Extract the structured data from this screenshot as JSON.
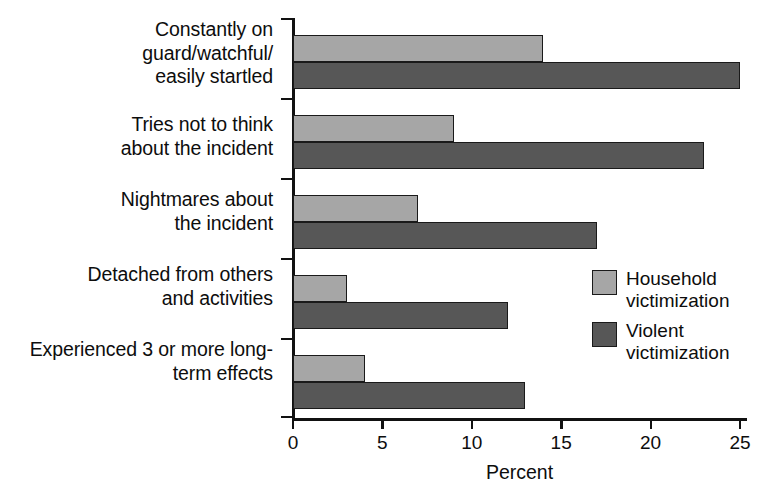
{
  "chart_data": {
    "type": "bar",
    "orientation": "horizontal",
    "title": "",
    "xlabel": "Percent",
    "ylabel": "",
    "xlim": [
      0,
      25
    ],
    "xticks": [
      0,
      5,
      10,
      15,
      20,
      25
    ],
    "xtick_labels": [
      "0",
      "5",
      "10",
      "15",
      "20",
      "25"
    ],
    "grid": false,
    "legend_position": "center-right",
    "categories": [
      "Constantly on\nguard/watchful/\neasily startled",
      "Tries not to think\nabout the incident",
      "Nightmares about\nthe incident",
      "Detached from others\nand activities",
      "Experienced 3 or more long-\nterm effects"
    ],
    "series": [
      {
        "name": "Household\nvictimization",
        "color": "#a6a6a6",
        "values": [
          14,
          9,
          7,
          3,
          4
        ]
      },
      {
        "name": "Violent\nvictimization",
        "color": "#575757",
        "values": [
          25,
          23,
          17,
          12,
          13
        ]
      }
    ]
  },
  "legend": {
    "items": [
      {
        "label": "Household\nvictimization",
        "color": "#a6a6a6"
      },
      {
        "label": "Violent\nvictimization",
        "color": "#575757"
      }
    ]
  },
  "axis": {
    "x_title": "Percent"
  }
}
